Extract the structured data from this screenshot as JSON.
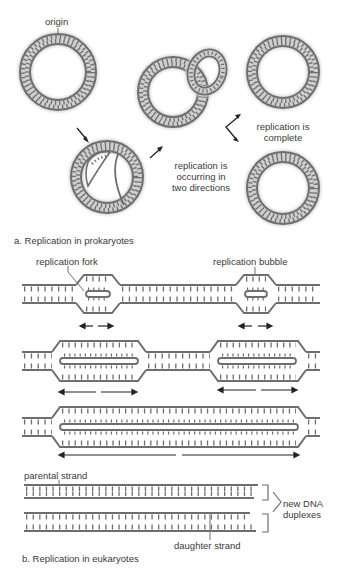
{
  "figure": {
    "panel_a": {
      "caption": "a. Replication in prokaryotes",
      "labels": {
        "origin": "origin",
        "occurring_line1": "replication is",
        "occurring_line2": "occurring in",
        "occurring_line3": "two directions",
        "complete_line1": "replication is",
        "complete_line2": "complete"
      }
    },
    "panel_b": {
      "caption": "b. Replication in eukaryotes",
      "labels": {
        "fork": "replication fork",
        "bubble": "replication bubble",
        "parental": "parental strand",
        "daughter": "daughter strand",
        "new_dna_line1": "new DNA",
        "new_dna_line2": "duplexes"
      }
    },
    "colors": {
      "strand": "#6e6e6e",
      "strand_shadow": "#c8c8c8",
      "text": "#3a3a3a",
      "arrow": "#222222"
    }
  }
}
